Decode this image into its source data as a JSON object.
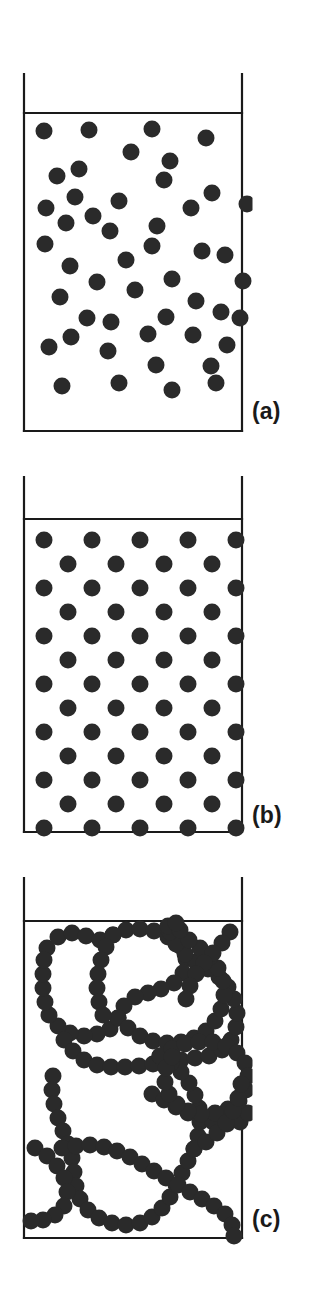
{
  "figure": {
    "width": 311,
    "height": 1302,
    "background": "#ffffff",
    "particle_color": "#2a2a2a",
    "line_color": "#1a1a1a"
  },
  "geometry": {
    "container_left": 24,
    "container_right": 242,
    "wall_thickness": 2.2,
    "particle_diameter": 17
  },
  "panels": [
    {
      "id": "a",
      "label": "(a)",
      "label_x": 252,
      "label_y": 400,
      "state_name": "disordered",
      "wall_top": 74,
      "fill_top": 113,
      "bottom": 431,
      "particle_count": 48,
      "particles": [
        [
          44,
          131
        ],
        [
          89,
          130
        ],
        [
          152,
          129
        ],
        [
          206,
          138
        ],
        [
          131,
          152
        ],
        [
          170,
          161
        ],
        [
          79,
          169
        ],
        [
          57,
          176
        ],
        [
          164,
          180
        ],
        [
          75,
          197
        ],
        [
          119,
          201
        ],
        [
          212,
          193
        ],
        [
          46,
          208
        ],
        [
          93,
          216
        ],
        [
          191,
          208
        ],
        [
          247,
          204
        ],
        [
          66,
          223
        ],
        [
          110,
          231
        ],
        [
          157,
          226
        ],
        [
          45,
          244
        ],
        [
          152,
          246
        ],
        [
          126,
          260
        ],
        [
          202,
          251
        ],
        [
          225,
          255
        ],
        [
          70,
          266
        ],
        [
          97,
          282
        ],
        [
          172,
          279
        ],
        [
          243,
          281
        ],
        [
          135,
          290
        ],
        [
          60,
          297
        ],
        [
          196,
          301
        ],
        [
          221,
          312
        ],
        [
          87,
          318
        ],
        [
          111,
          322
        ],
        [
          166,
          317
        ],
        [
          240,
          318
        ],
        [
          71,
          337
        ],
        [
          148,
          334
        ],
        [
          193,
          335
        ],
        [
          49,
          347
        ],
        [
          108,
          351
        ],
        [
          227,
          345
        ],
        [
          156,
          365
        ],
        [
          211,
          366
        ],
        [
          62,
          386
        ],
        [
          119,
          383
        ],
        [
          172,
          390
        ],
        [
          216,
          383
        ]
      ]
    },
    {
      "id": "b",
      "label": "(b)",
      "label_x": 252,
      "label_y": 804,
      "state_name": "crystalline",
      "wall_top": 477,
      "fill_top": 519,
      "bottom": 832,
      "lattice": {
        "type": "hexagonal-close-packed",
        "row_spacing": 24,
        "column_spacing": 48,
        "row_offset": 24,
        "first_row_y": 540,
        "first_row_x": 44,
        "rows_full": 7,
        "rows_offset": 6,
        "particles_per_full_row": 5,
        "particles_per_offset_row": 4
      },
      "particle_count": 59
    },
    {
      "id": "c",
      "label": "(c)",
      "label_x": 252,
      "label_y": 1208,
      "state_name": "polymer-network",
      "wall_top": 878,
      "fill_top": 921,
      "bottom": 1238,
      "bead_spacing": 14,
      "chains": [
        [
          [
            47,
            948
          ],
          [
            58,
            937
          ],
          [
            72,
            933
          ],
          [
            86,
            936
          ],
          [
            100,
            940
          ],
          [
            113,
            935
          ],
          [
            126,
            930
          ],
          [
            140,
            929
          ],
          [
            154,
            931
          ],
          [
            168,
            937
          ],
          [
            180,
            946
          ],
          [
            186,
            959
          ],
          [
            183,
            973
          ],
          [
            174,
            983
          ],
          [
            161,
            989
          ],
          [
            148,
            993
          ],
          [
            135,
            997
          ],
          [
            124,
            1006
          ],
          [
            118,
            1018
          ],
          [
            110,
            1029
          ],
          [
            97,
            1034
          ],
          [
            84,
            1036
          ],
          [
            70,
            1033
          ],
          [
            58,
            1026
          ],
          [
            49,
            1015
          ],
          [
            45,
            1002
          ],
          [
            43,
            988
          ],
          [
            43,
            974
          ],
          [
            44,
            960
          ]
        ],
        [
          [
            64,
            1040
          ],
          [
            73,
            1051
          ],
          [
            84,
            1060
          ],
          [
            97,
            1065
          ],
          [
            111,
            1067
          ],
          [
            125,
            1067
          ],
          [
            139,
            1066
          ],
          [
            153,
            1064
          ],
          [
            167,
            1062
          ],
          [
            181,
            1060
          ],
          [
            195,
            1058
          ],
          [
            209,
            1056
          ],
          [
            222,
            1050
          ],
          [
            231,
            1040
          ],
          [
            236,
            1027
          ],
          [
            237,
            1013
          ],
          [
            234,
            999
          ],
          [
            228,
            987
          ],
          [
            219,
            977
          ],
          [
            208,
            969
          ],
          [
            196,
            962
          ],
          [
            185,
            954
          ],
          [
            176,
            944
          ],
          [
            170,
            932
          ],
          [
            168,
            926
          ]
        ],
        [
          [
            53,
            1076
          ],
          [
            52,
            1090
          ],
          [
            54,
            1104
          ],
          [
            58,
            1118
          ],
          [
            63,
            1131
          ],
          [
            68,
            1144
          ],
          [
            72,
            1158
          ],
          [
            74,
            1172
          ],
          [
            76,
            1186
          ],
          [
            80,
            1199
          ],
          [
            88,
            1210
          ],
          [
            99,
            1218
          ],
          [
            112,
            1223
          ],
          [
            126,
            1225
          ],
          [
            140,
            1223
          ],
          [
            152,
            1217
          ],
          [
            162,
            1208
          ],
          [
            170,
            1197
          ],
          [
            176,
            1185
          ],
          [
            182,
            1173
          ],
          [
            188,
            1161
          ],
          [
            194,
            1149
          ],
          [
            198,
            1136
          ],
          [
            200,
            1122
          ],
          [
            199,
            1108
          ],
          [
            195,
            1095
          ],
          [
            189,
            1083
          ],
          [
            181,
            1072
          ],
          [
            171,
            1063
          ],
          [
            160,
            1056
          ]
        ],
        [
          [
            62,
            1148
          ],
          [
            76,
            1146
          ],
          [
            90,
            1145
          ],
          [
            104,
            1147
          ],
          [
            117,
            1151
          ],
          [
            130,
            1157
          ],
          [
            142,
            1164
          ],
          [
            154,
            1171
          ],
          [
            166,
            1178
          ],
          [
            178,
            1185
          ],
          [
            190,
            1192
          ],
          [
            202,
            1199
          ],
          [
            214,
            1206
          ],
          [
            225,
            1214
          ],
          [
            232,
            1225
          ],
          [
            234,
            1236
          ]
        ],
        [
          [
            35,
            1148
          ],
          [
            47,
            1156
          ],
          [
            57,
            1166
          ],
          [
            64,
            1178
          ],
          [
            67,
            1192
          ],
          [
            64,
            1206
          ],
          [
            55,
            1215
          ],
          [
            43,
            1220
          ],
          [
            31,
            1221
          ]
        ],
        [
          [
            118,
            1018
          ],
          [
            128,
            1028
          ],
          [
            140,
            1036
          ],
          [
            153,
            1041
          ],
          [
            167,
            1043
          ],
          [
            181,
            1042
          ],
          [
            194,
            1038
          ],
          [
            206,
            1031
          ],
          [
            215,
            1021
          ],
          [
            221,
            1009
          ],
          [
            224,
            995
          ],
          [
            223,
            981
          ],
          [
            218,
            968
          ],
          [
            210,
            957
          ],
          [
            200,
            948
          ],
          [
            189,
            940
          ],
          [
            180,
            930
          ],
          [
            176,
            923
          ]
        ],
        [
          [
            152,
            1094
          ],
          [
            164,
            1100
          ],
          [
            176,
            1107
          ],
          [
            188,
            1113
          ],
          [
            200,
            1118
          ],
          [
            213,
            1122
          ],
          [
            227,
            1124
          ],
          [
            240,
            1122
          ],
          [
            248,
            1113
          ]
        ],
        [
          [
            160,
            1056
          ],
          [
            172,
            1049
          ],
          [
            185,
            1044
          ],
          [
            199,
            1042
          ],
          [
            213,
            1042
          ],
          [
            226,
            1046
          ],
          [
            237,
            1053
          ],
          [
            245,
            1063
          ],
          [
            248,
            1076
          ],
          [
            246,
            1090
          ],
          [
            239,
            1101
          ],
          [
            228,
            1109
          ],
          [
            215,
            1113
          ],
          [
            201,
            1114
          ],
          [
            188,
            1111
          ],
          [
            177,
            1104
          ],
          [
            169,
            1094
          ],
          [
            165,
            1082
          ],
          [
            166,
            1068
          ],
          [
            172,
            1057
          ]
        ],
        [
          [
            194,
            1149
          ],
          [
            206,
            1142
          ],
          [
            217,
            1133
          ],
          [
            226,
            1123
          ],
          [
            233,
            1111
          ],
          [
            238,
            1098
          ],
          [
            241,
            1084
          ]
        ],
        [
          [
            113,
            935
          ],
          [
            106,
            947
          ],
          [
            101,
            960
          ],
          [
            98,
            974
          ],
          [
            97,
            988
          ],
          [
            99,
            1002
          ],
          [
            103,
            1015
          ]
        ],
        [
          [
            230,
            932
          ],
          [
            222,
            943
          ],
          [
            213,
            953
          ],
          [
            204,
            963
          ],
          [
            196,
            974
          ],
          [
            190,
            986
          ],
          [
            186,
            999
          ]
        ]
      ]
    }
  ]
}
